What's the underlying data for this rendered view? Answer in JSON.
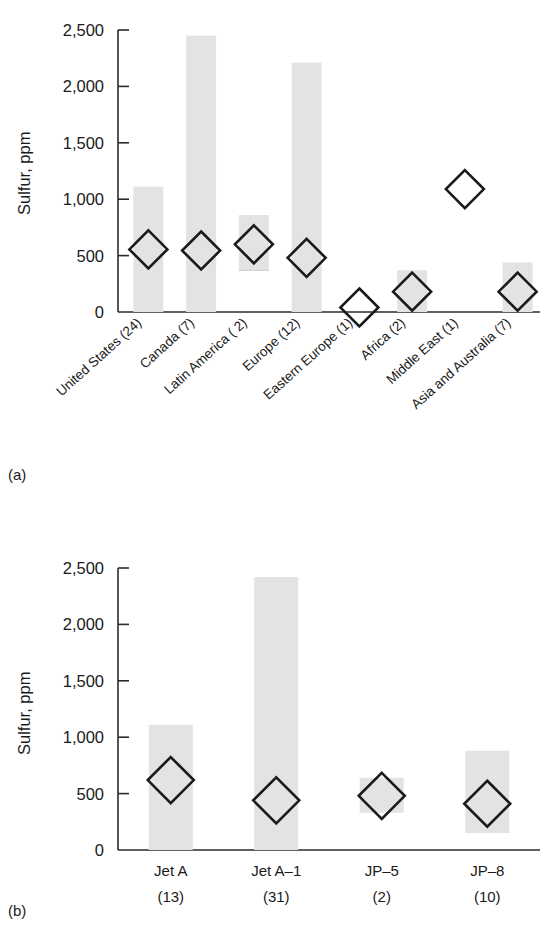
{
  "figure": {
    "panel_a_tag": "(a)",
    "panel_b_tag": "(b)",
    "axis_title": "Sulfur, ppm"
  },
  "chart_data": [
    {
      "type": "bar",
      "id": "panel-a",
      "title": "",
      "subtitle": "",
      "xlabel": "",
      "ylabel": "Sulfur, ppm",
      "ylim": [
        0,
        2500
      ],
      "yticks": [
        0,
        500,
        1000,
        1500,
        2000,
        2500
      ],
      "ytick_labels": [
        "0",
        "500",
        "1,000",
        "1,500",
        "2,000",
        "2,500"
      ],
      "grid": false,
      "legend": "none",
      "note": "Floating range bars show min-to-max sulfur content; open diamonds mark the average value.",
      "categories": [
        "United States (24)",
        "Canada (7)",
        "Latin America ( 2)",
        "Europe (12)",
        "Eastern Europe (1)",
        "Africa (2)",
        "Middle East (1)",
        "Asia and Australia (7)"
      ],
      "series": [
        {
          "name": "Range (min–max)",
          "kind": "range-bar",
          "lows": [
            0,
            0,
            370,
            0,
            40,
            0,
            1090,
            0
          ],
          "highs": [
            1110,
            2450,
            860,
            2210,
            40,
            370,
            1090,
            440
          ]
        },
        {
          "name": "Average",
          "kind": "diamond-marker",
          "values": [
            555,
            545,
            600,
            480,
            40,
            180,
            1090,
            180
          ]
        }
      ]
    },
    {
      "type": "bar",
      "id": "panel-b",
      "title": "",
      "subtitle": "",
      "xlabel": "",
      "ylabel": "Sulfur, ppm",
      "ylim": [
        0,
        2500
      ],
      "yticks": [
        0,
        500,
        1000,
        1500,
        2000,
        2500
      ],
      "ytick_labels": [
        "0",
        "500",
        "1,000",
        "1,500",
        "2,000",
        "2,500"
      ],
      "grid": false,
      "legend": "none",
      "note": "Floating range bars show min-to-max sulfur content; open diamonds mark the average value.",
      "categories": [
        "Jet A",
        "Jet A–1",
        "JP–5",
        "JP–8"
      ],
      "category_counts": [
        "(13)",
        "(31)",
        "(2)",
        "(10)"
      ],
      "series": [
        {
          "name": "Range (min–max)",
          "kind": "range-bar",
          "lows": [
            0,
            0,
            330,
            150
          ],
          "highs": [
            1110,
            2420,
            640,
            880
          ]
        },
        {
          "name": "Average",
          "kind": "diamond-marker",
          "values": [
            620,
            440,
            480,
            410
          ]
        }
      ]
    }
  ]
}
